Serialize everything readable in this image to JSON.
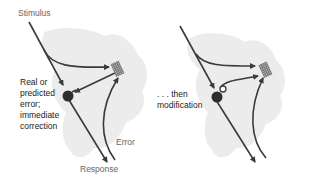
{
  "left_panel": {
    "stimulus_label": "Stimulus",
    "annotation_lines": [
      "Real or",
      "predicted",
      "error;",
      "immediate",
      "correction"
    ],
    "error_label": "Error",
    "response_label": "Response"
  },
  "right_panel": {
    "annotation_lines": [
      ". . . then",
      "modification"
    ]
  },
  "colors": {
    "line": "#3a3a3a",
    "cloud": "#ececec",
    "node": "#2e2e2e",
    "label_grey": "#6a6a6a"
  }
}
